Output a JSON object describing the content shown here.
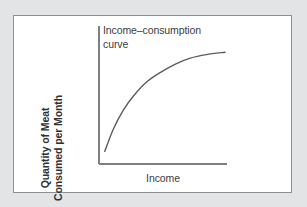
{
  "figure": {
    "background_color": "#e3e4e5",
    "panel_color": "#ffffff",
    "border_color": "#8d8f91"
  },
  "chart_data": {
    "type": "line",
    "title": "Income–consumption\ncurve",
    "title_line_1": "Income–consumption",
    "title_line_2": "curve",
    "xlabel": "Income",
    "ylabel": "Quantity of Meat Consumed per Month",
    "ylabel_line_1": "Quantity of Meat",
    "ylabel_line_2": "Consumed per Month",
    "grid": false,
    "legend": false,
    "xlim": [
      0,
      1
    ],
    "ylim": [
      0,
      1
    ],
    "xticks": [],
    "yticks": [],
    "axis_color": "#7d7f81",
    "series": [
      {
        "name": "Income–consumption curve",
        "color": "#5a5c5e",
        "x": [
          0.03,
          0.1,
          0.18,
          0.27,
          0.37,
          0.48,
          0.6,
          0.72,
          0.85,
          1.0
        ],
        "y": [
          0.09,
          0.28,
          0.44,
          0.57,
          0.68,
          0.76,
          0.83,
          0.88,
          0.91,
          0.93
        ]
      }
    ],
    "annotations": [
      {
        "text": "Income–consumption curve",
        "target": "curve"
      }
    ]
  }
}
